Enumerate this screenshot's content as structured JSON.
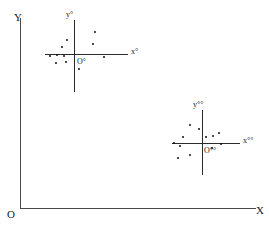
{
  "figure": {
    "type": "scatter"
  },
  "global_axes": {
    "y_label": "Y",
    "origin_label": "O",
    "x_label": "X",
    "color": "#4a4a4a"
  },
  "clusters": [
    {
      "name": "cluster-1",
      "y_label": "y°",
      "x_label": "x°",
      "origin_label": "O°",
      "center": {
        "x": 74,
        "y": 54
      },
      "points": [
        {
          "x": 95,
          "y": 32
        },
        {
          "x": 93,
          "y": 44
        },
        {
          "x": 67,
          "y": 40
        },
        {
          "x": 62,
          "y": 47
        },
        {
          "x": 57,
          "y": 55
        },
        {
          "x": 64,
          "y": 56
        },
        {
          "x": 50,
          "y": 56
        },
        {
          "x": 56,
          "y": 63
        },
        {
          "x": 66,
          "y": 62
        },
        {
          "x": 79,
          "y": 69
        },
        {
          "x": 104,
          "y": 57
        }
      ]
    },
    {
      "name": "cluster-2",
      "y_label": "y°°",
      "x_label": "x°°",
      "origin_label": "O°°",
      "center": {
        "x": 202,
        "y": 143
      },
      "points": [
        {
          "x": 190,
          "y": 125
        },
        {
          "x": 183,
          "y": 137
        },
        {
          "x": 206,
          "y": 137
        },
        {
          "x": 213,
          "y": 136
        },
        {
          "x": 219,
          "y": 133
        },
        {
          "x": 174,
          "y": 143
        },
        {
          "x": 180,
          "y": 146
        },
        {
          "x": 212,
          "y": 148
        },
        {
          "x": 190,
          "y": 155
        },
        {
          "x": 178,
          "y": 158
        },
        {
          "x": 199,
          "y": 129
        },
        {
          "x": 221,
          "y": 144
        }
      ]
    }
  ],
  "chart_data": {
    "type": "scatter",
    "title": "",
    "xlabel": "X",
    "ylabel": "Y",
    "grid": false,
    "legend": null,
    "annotations": [
      "Y",
      "O",
      "X",
      "y°",
      "x°",
      "O°",
      "y°°",
      "x°°",
      "O°°"
    ],
    "series": [
      {
        "name": "cluster-1",
        "local_frame": {
          "origin": "O°",
          "x_axis": "x°",
          "y_axis": "y°"
        },
        "x": [
          21,
          19,
          -7,
          -12,
          -17,
          -10,
          -24,
          -18,
          -8,
          5,
          30
        ],
        "y": [
          22,
          10,
          14,
          7,
          -1,
          -2,
          -2,
          -9,
          -8,
          -15,
          -3
        ]
      },
      {
        "name": "cluster-2",
        "local_frame": {
          "origin": "O°°",
          "x_axis": "x°°",
          "y_axis": "y°°"
        },
        "x": [
          -12,
          -19,
          4,
          11,
          17,
          -28,
          -22,
          10,
          -12,
          -24,
          -3,
          19
        ],
        "y": [
          18,
          6,
          6,
          7,
          10,
          0,
          -3,
          -5,
          -12,
          -15,
          14,
          -1
        ]
      }
    ]
  }
}
